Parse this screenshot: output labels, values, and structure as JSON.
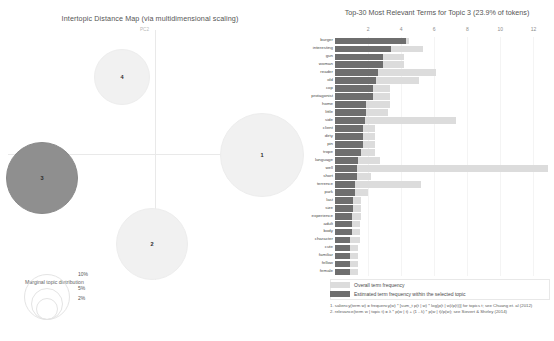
{
  "left_panel": {
    "title": "Intertopic Distance Map (via multidimensional scaling)",
    "axis_labels": {
      "vertical": "PC2",
      "horizontal": "PC1"
    },
    "legend_title": "Marginal topic distribution",
    "legend_sizes": [
      "2%",
      "5%",
      "10%"
    ],
    "topics": [
      {
        "id": "1",
        "label": "1",
        "cx": 261,
        "cy": 154,
        "r": 41,
        "selected": false
      },
      {
        "id": "2",
        "label": "2",
        "cx": 151,
        "cy": 243,
        "r": 35,
        "selected": false
      },
      {
        "id": "3",
        "label": "3",
        "cx": 41,
        "cy": 177,
        "r": 35,
        "selected": true
      },
      {
        "id": "4",
        "label": "4",
        "cx": 121,
        "cy": 76,
        "r": 27,
        "selected": false
      }
    ],
    "colors": {
      "selected_fill": "#8f8f8f",
      "unselected_fill": "#f1f1f1"
    }
  },
  "right_panel": {
    "title": "Top-30 Most Relevant Terms for Topic 3 (23.9% of tokens)",
    "legend": {
      "overall_label": "Overall term frequency",
      "topic_label": "Estimated term frequency within the selected topic"
    },
    "notes": [
      "1. saliency(term w) = frequency(w) * [sum_t p(t | w) * log(p(t | w)/p(t))] for topics t; see Chuang et. al (2012)",
      "2. relevance(term w | topic t) = λ * p(w | t) + (1 - λ) * p(w | t)/p(w); see Sievert & Shirley (2014)"
    ],
    "colors": {
      "overall": "#dcdcdc",
      "topic": "#6e6e6e"
    }
  },
  "chart_data": {
    "type": "bar",
    "title": "Top-30 Most Relevant Terms for Topic 3 (23.9% of tokens)",
    "xlabel": "",
    "ylabel": "",
    "xlim": [
      0,
      13
    ],
    "ticks": [
      2,
      4,
      6,
      8,
      10,
      12
    ],
    "grid": true,
    "legend_position": "bottom",
    "orientation": "horizontal",
    "categories": [
      "burger",
      "interesting",
      "gun",
      "woman",
      "reader",
      "old",
      "cop",
      "protagonist",
      "home",
      "little",
      "side",
      "client",
      "dirty",
      "pin",
      "trope",
      "language",
      "well",
      "short",
      "terrence",
      "park",
      "last",
      "size",
      "experience",
      "adult",
      "body",
      "character",
      "cute",
      "familiar",
      "fellow",
      "female"
    ],
    "series": [
      {
        "name": "Overall term frequency",
        "values": [
          4.5,
          5.3,
          4.2,
          4.2,
          6.1,
          5.1,
          3.3,
          3.3,
          3.3,
          3.2,
          7.3,
          2.4,
          2.4,
          2.4,
          2.4,
          2.7,
          12.9,
          2.2,
          5.2,
          2.0,
          1.6,
          1.6,
          1.6,
          1.5,
          1.5,
          1.5,
          1.4,
          1.4,
          1.4,
          1.4
        ]
      },
      {
        "name": "Estimated term frequency within the selected topic",
        "values": [
          4.3,
          3.4,
          2.9,
          2.9,
          2.6,
          2.5,
          2.3,
          2.3,
          1.9,
          1.9,
          1.8,
          1.7,
          1.7,
          1.7,
          1.6,
          1.4,
          1.3,
          1.3,
          1.2,
          1.2,
          1.1,
          1.1,
          1.0,
          1.0,
          1.0,
          0.9,
          0.9,
          0.9,
          0.9,
          0.9
        ]
      }
    ]
  }
}
